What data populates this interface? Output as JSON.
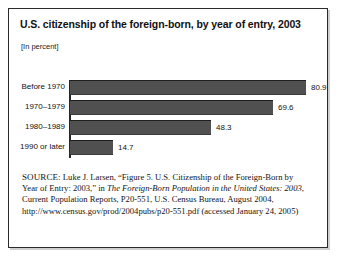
{
  "figure": {
    "title": "U.S. citizenship of the foreign-born, by year of entry, 2003",
    "subtitle": "[In percent]"
  },
  "chart_data": {
    "type": "bar",
    "orientation": "horizontal",
    "title": "U.S. citizenship of the foreign-born, by year of entry, 2003",
    "subtitle": "[In percent]",
    "xlabel": "",
    "ylabel": "",
    "categories": [
      "Before 1970",
      "1970–1979",
      "1980–1989",
      "1990 or later"
    ],
    "values": [
      80.9,
      69.6,
      48.3,
      14.7
    ],
    "value_labels": [
      "80.9",
      "69.6",
      "48.3",
      "14.7"
    ],
    "xlim": [
      0,
      80.9
    ],
    "grid": false,
    "legend": false,
    "bar_color": "#4c4c4c"
  },
  "source": {
    "label": "SOURCE:",
    "text_1": " Luke J. Larsen, “Figure 5. U.S. Citizenship of the Foreign-Born by Year of Entry: 2003,” in ",
    "italic_title": "The Foreign-Born Population in the United States: 2003",
    "text_2": ", Current Population Reports, P20-551, U.S. Census Bureau, August 2004, http://www.census.gov/prod/2004pubs/p20-551.pdf (accessed January 24, 2005)"
  }
}
